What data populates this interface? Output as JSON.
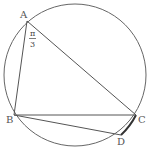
{
  "diagram": {
    "type": "inscribed-quadrilateral",
    "circle": {
      "cx": 75,
      "cy": 75,
      "r": 71
    },
    "points": {
      "A": {
        "x": 27,
        "y": 21,
        "label": "A"
      },
      "B": {
        "x": 14,
        "y": 115,
        "label": "B"
      },
      "C": {
        "x": 136,
        "y": 115,
        "label": "C"
      },
      "D": {
        "x": 121,
        "y": 135,
        "label": "D"
      }
    },
    "segments": [
      "AB",
      "AC",
      "BC",
      "BD"
    ],
    "highlighted_arc": "CD",
    "angle_label": {
      "vertex": "A",
      "numerator": "π",
      "denominator": "3"
    },
    "colors": {
      "stroke": "#555555",
      "arc_highlight": "#333333",
      "background": "#ffffff"
    }
  }
}
